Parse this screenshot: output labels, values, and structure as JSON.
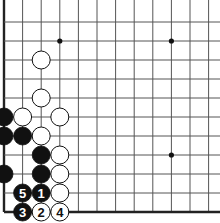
{
  "board": {
    "description": "Go board corner diagram (lower-left corner, top and right edges cropped)",
    "columns": 12,
    "rows": 11,
    "origin_x": 4,
    "origin_y": 22,
    "spacing_x": 18.6,
    "spacing_y": 19,
    "edges": {
      "left": true,
      "bottom": true,
      "top": false,
      "right": false
    },
    "colors": {
      "line": "#555555",
      "edge": "#222222",
      "black": "#111111",
      "white": "#ffffff",
      "star": "#111111"
    },
    "star_points": [
      {
        "col": 3,
        "row": 1
      },
      {
        "col": 9,
        "row": 1
      },
      {
        "col": 9,
        "row": 7
      }
    ],
    "stones": [
      {
        "color": "white",
        "col": 2,
        "row": 2,
        "label": ""
      },
      {
        "color": "white",
        "col": 2,
        "row": 4,
        "label": ""
      },
      {
        "color": "black",
        "col": 0,
        "row": 5,
        "label": ""
      },
      {
        "color": "white",
        "col": 1,
        "row": 5,
        "label": ""
      },
      {
        "color": "white",
        "col": 3,
        "row": 5,
        "label": ""
      },
      {
        "color": "black",
        "col": 0,
        "row": 6,
        "label": ""
      },
      {
        "color": "black",
        "col": 1,
        "row": 6,
        "label": ""
      },
      {
        "color": "white",
        "col": 2,
        "row": 6,
        "label": ""
      },
      {
        "color": "black",
        "col": 2,
        "row": 7,
        "label": ""
      },
      {
        "color": "white",
        "col": 3,
        "row": 7,
        "label": ""
      },
      {
        "color": "black",
        "col": 0,
        "row": 8,
        "label": ""
      },
      {
        "color": "black",
        "col": 2,
        "row": 8,
        "label": ""
      },
      {
        "color": "white",
        "col": 3,
        "row": 8,
        "label": ""
      },
      {
        "color": "black",
        "col": 1,
        "row": 9,
        "label": "5"
      },
      {
        "color": "black",
        "col": 2,
        "row": 9,
        "label": "1"
      },
      {
        "color": "white",
        "col": 3,
        "row": 9,
        "label": ""
      },
      {
        "color": "black",
        "col": 1,
        "row": 10,
        "label": "3"
      },
      {
        "color": "white",
        "col": 2,
        "row": 10,
        "label": "2"
      },
      {
        "color": "white",
        "col": 3,
        "row": 10,
        "label": "4"
      }
    ]
  }
}
